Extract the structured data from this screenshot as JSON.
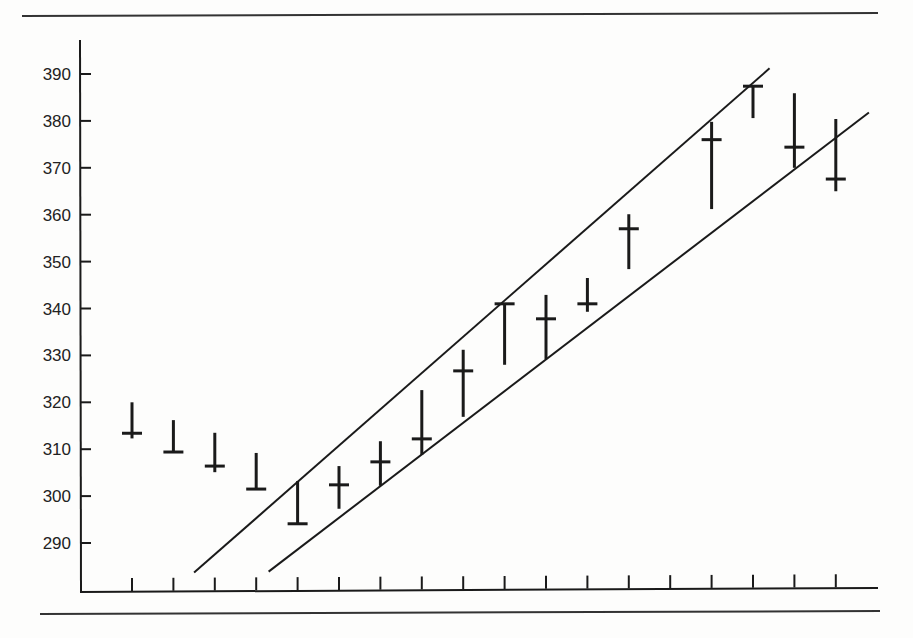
{
  "chart_data": {
    "type": "bar",
    "subtype": "high-low-close with trend channel",
    "title": "",
    "xlabel": "",
    "ylabel": "",
    "ylim": [
      280,
      395
    ],
    "yticks": [
      290,
      300,
      310,
      320,
      330,
      340,
      350,
      360,
      370,
      380,
      390
    ],
    "xtick_count": 18,
    "grid": false,
    "legend": null,
    "colors": {
      "ink": "#1a1a1a",
      "background": "#fdfdfc"
    },
    "series": [
      {
        "name": "price",
        "bars": [
          {
            "index": 0,
            "high": 320.0,
            "low": 312.3,
            "close": 313.4
          },
          {
            "index": 1,
            "high": 316.2,
            "low": 309.4,
            "close": 309.4
          },
          {
            "index": 2,
            "high": 313.5,
            "low": 305.1,
            "close": 306.4
          },
          {
            "index": 3,
            "high": 309.2,
            "low": 301.5,
            "close": 301.5
          },
          {
            "index": 4,
            "high": 303.2,
            "low": 294.1,
            "close": 294.1
          },
          {
            "index": 5,
            "high": 306.4,
            "low": 297.3,
            "close": 302.4
          },
          {
            "index": 6,
            "high": 311.7,
            "low": 302.2,
            "close": 307.3
          },
          {
            "index": 7,
            "high": 322.6,
            "low": 308.8,
            "close": 312.2
          },
          {
            "index": 8,
            "high": 331.2,
            "low": 316.9,
            "close": 326.7
          },
          {
            "index": 9,
            "high": 341.0,
            "low": 328.0,
            "close": 341.0
          },
          {
            "index": 10,
            "high": 342.9,
            "low": 329.2,
            "close": 337.8
          },
          {
            "index": 11,
            "high": 346.5,
            "low": 339.3,
            "close": 341.0
          },
          {
            "index": 12,
            "high": 360.1,
            "low": 348.4,
            "close": 357.0
          },
          {
            "index": 14,
            "high": 379.8,
            "low": 361.2,
            "close": 376.0
          },
          {
            "index": 15,
            "high": 387.4,
            "low": 380.6,
            "close": 387.4
          },
          {
            "index": 16,
            "high": 385.9,
            "low": 370.0,
            "close": 374.4
          },
          {
            "index": 17,
            "high": 380.4,
            "low": 365.0,
            "close": 367.6
          }
        ]
      }
    ],
    "trendlines": [
      {
        "name": "upper-channel",
        "start": {
          "x_index": 1.5,
          "y": 283.7
        },
        "end": {
          "x_index": 15.4,
          "y": 391.2
        }
      },
      {
        "name": "lower-channel",
        "start": {
          "x_index": 3.3,
          "y": 283.9
        },
        "end": {
          "x_index": 17.8,
          "y": 381.8
        }
      }
    ]
  }
}
